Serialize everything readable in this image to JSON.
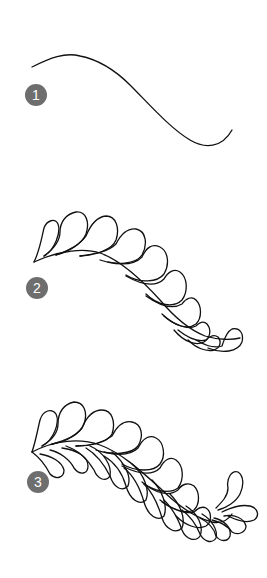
{
  "diagram": {
    "type": "step-by-step feather quilting motif",
    "badge_color": "#6e6e6e",
    "line_color": "#111111",
    "steps": [
      {
        "number": "1",
        "description": "Draw a gentle S-curve spine"
      },
      {
        "number": "2",
        "description": "Add teardrop plumes along the top of the spine"
      },
      {
        "number": "3",
        "description": "Add plumes along the bottom of the spine"
      }
    ]
  }
}
